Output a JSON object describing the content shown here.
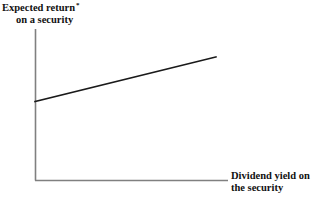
{
  "chart_data": {
    "type": "line",
    "title": "",
    "subtitle": "",
    "ylabel_line1": "Expected return",
    "ylabel_line2": "on a security",
    "ylabel_footnote_mark": "*",
    "xlabel_line1": "Dividend yield on",
    "xlabel_line2": "the security",
    "xlabel": "Dividend yield on the security",
    "ylabel": "Expected return on a security",
    "grid": false,
    "legend": null,
    "legend_position": "none",
    "tick_labels_x": [],
    "tick_labels_y": [],
    "xlim": [
      0,
      1
    ],
    "ylim": [
      0,
      1
    ],
    "series": [
      {
        "name": "Expected return schedule",
        "x": [
          0.0,
          1.0
        ],
        "values": [
          0.525,
          0.82
        ],
        "description": "Upward-sloping straight line indicating expected return rises with dividend yield",
        "color": "#1a1a1a"
      }
    ],
    "annotations": []
  },
  "figure": {
    "background_color": "#ffffff",
    "axis_color": "#808080",
    "line_color": "#1a1a1a",
    "text_color": "#111111",
    "width": 321,
    "height": 201
  },
  "geometry": {
    "y_axis_x": 35,
    "y_axis_top": 29,
    "x_axis_y": 180,
    "x_axis_right": 228,
    "line_start_x": 35,
    "line_start_y": 101,
    "line_end_x": 216,
    "line_end_y": 57
  }
}
